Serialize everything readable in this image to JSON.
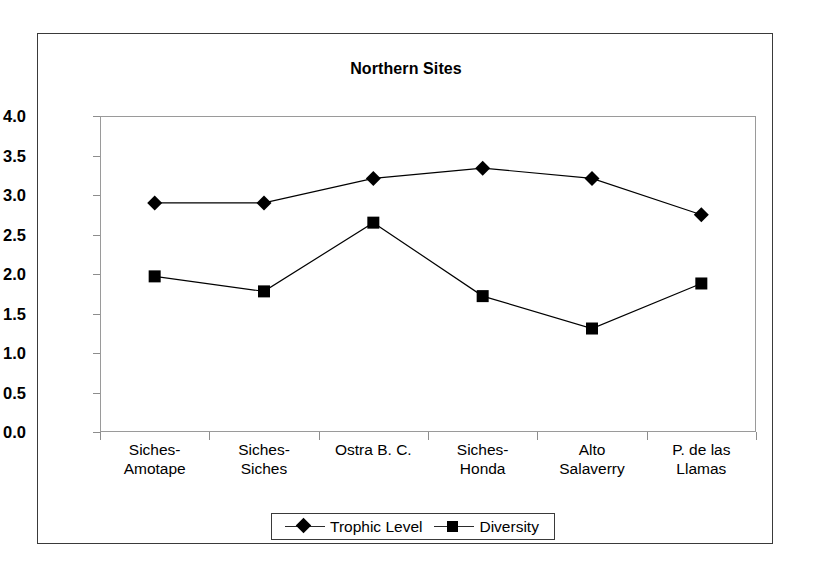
{
  "chart_data": {
    "type": "line",
    "title": "Northern Sites",
    "xlabel": "",
    "ylabel": "",
    "ylim": [
      0.0,
      4.0
    ],
    "ytick_labels": [
      "4.0",
      "3.5",
      "3.0",
      "2.5",
      "2.0",
      "1.5",
      "1.0",
      "0.5",
      "0.0"
    ],
    "ytick_values": [
      4.0,
      3.5,
      3.0,
      2.5,
      2.0,
      1.5,
      1.0,
      0.5,
      0.0
    ],
    "grid": false,
    "legend_position": "bottom",
    "categories": [
      "Siches-\nAmotape",
      "Siches-\nSiches",
      "Ostra B. C.",
      "Siches-\nHonda",
      "Alto\nSalaverry",
      "P. de las\nLlamas"
    ],
    "series": [
      {
        "name": "Trophic Level",
        "marker": "diamond",
        "color": "#000000",
        "values": [
          2.9,
          2.9,
          3.21,
          3.34,
          3.21,
          2.75
        ]
      },
      {
        "name": "Diversity",
        "marker": "square",
        "color": "#000000",
        "values": [
          1.97,
          1.78,
          2.65,
          1.72,
          1.31,
          1.88
        ]
      }
    ]
  },
  "legend": {
    "items": [
      {
        "label": "Trophic Level",
        "marker": "diamond-marker-icon"
      },
      {
        "label": "Diversity",
        "marker": "square-marker-icon"
      }
    ]
  }
}
